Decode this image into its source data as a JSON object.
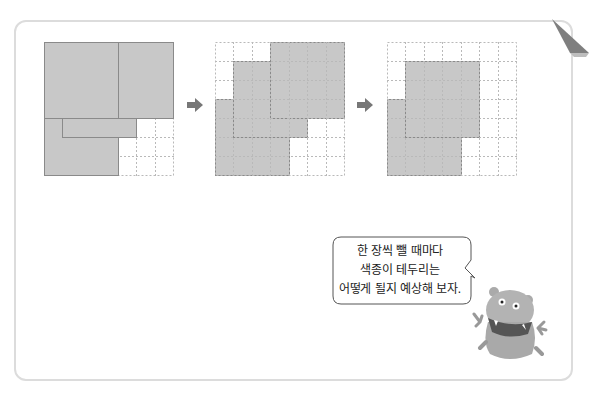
{
  "illustration": {
    "grid_cols": 7,
    "grid_rows": 7,
    "colors": {
      "paper_fill": "#c8c8c8",
      "paper_border": "#8a8a8a",
      "grid_line": "#b9b9b9",
      "arrow": "#777777",
      "card_border": "#dcdcdc"
    },
    "steps": [
      {
        "name": "step-1",
        "label": "all papers stacked"
      },
      {
        "name": "step-2",
        "label": "one paper removed"
      },
      {
        "name": "step-3",
        "label": "two papers removed"
      }
    ]
  },
  "speech_bubble": {
    "lines": [
      "한 장씩 뺄 때마다",
      "색종이 테두리는",
      "어떻게 될지 예상해 보자."
    ]
  }
}
